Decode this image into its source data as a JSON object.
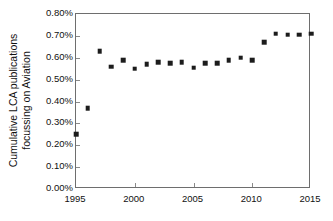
{
  "chart_data": {
    "type": "scatter",
    "title": "",
    "xlabel": "",
    "ylabel": "Cumulative LCA publications focussing on Aviation",
    "ylabel_lines": [
      "Cumulative LCA publications",
      "focussing on Aviation"
    ],
    "xlim": [
      1995,
      2015
    ],
    "ylim": [
      0.0,
      0.8
    ],
    "y_unit": "%",
    "grid": false,
    "legend": null,
    "marker": "square",
    "marker_color": "#1c1c1c",
    "x_ticks": [
      1995,
      2000,
      2005,
      2010,
      2015
    ],
    "x_tick_labels": [
      "1995",
      "2000",
      "2005",
      "2010",
      "2015"
    ],
    "y_ticks": [
      0.0,
      0.1,
      0.2,
      0.3,
      0.4,
      0.5,
      0.6,
      0.7,
      0.8
    ],
    "y_tick_labels": [
      "0.00%",
      "0.10%",
      "0.20%",
      "0.30%",
      "0.40%",
      "0.50%",
      "0.60%",
      "0.70%",
      "0.80%"
    ],
    "x": [
      1995,
      1996,
      1997,
      1998,
      1999,
      2000,
      2001,
      2002,
      2003,
      2004,
      2005,
      2006,
      2007,
      2008,
      2009,
      2010,
      2011,
      2012,
      2013,
      2014,
      2015
    ],
    "values": [
      0.25,
      0.37,
      0.63,
      0.56,
      0.59,
      0.55,
      0.57,
      0.58,
      0.575,
      0.58,
      0.555,
      0.575,
      0.575,
      0.59,
      0.6,
      0.59,
      0.67,
      0.71,
      0.705,
      0.705,
      0.71
    ],
    "series": [
      {
        "name": "Cumulative LCA publications focussing on Aviation",
        "values": [
          0.25,
          0.37,
          0.63,
          0.56,
          0.59,
          0.55,
          0.57,
          0.58,
          0.575,
          0.58,
          0.555,
          0.575,
          0.575,
          0.59,
          0.6,
          0.59,
          0.67,
          0.71,
          0.705,
          0.705,
          0.71
        ]
      }
    ]
  }
}
